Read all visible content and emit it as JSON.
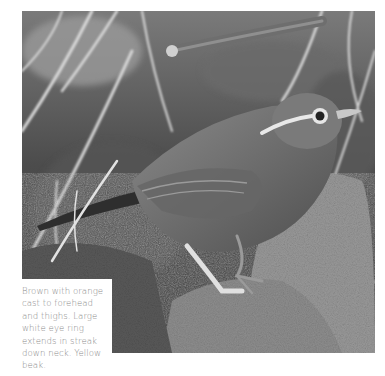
{
  "photo": {
    "subject": "bird-perched-on-rock",
    "alt": "Grayscale photo of a small brown bird standing on a mossy rock among dry grass"
  },
  "caption": {
    "text": "Brown with orange cast to forehead and thighs. Large white eye ring extends in streak down neck. Yellow beak."
  },
  "colors": {
    "background": "#ffffff",
    "caption_text": "#8a8a8a",
    "caption_bg": "#ffffff"
  }
}
